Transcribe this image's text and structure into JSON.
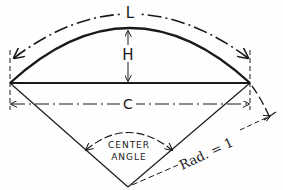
{
  "diagram": {
    "title": "",
    "labels": {
      "arc_length": "L",
      "height": "H",
      "chord": "C",
      "center_angle_line1": "CENTER",
      "center_angle_line2": "ANGLE",
      "radius": "Rad. = 1"
    },
    "elements": [
      {
        "name": "arc",
        "description": "circular arc segment (solid)"
      },
      {
        "name": "chord",
        "description": "straight line joining arc endpoints (solid)"
      },
      {
        "name": "arc-length-dimension",
        "label": "L",
        "style": "dash-dot with arrows"
      },
      {
        "name": "height-dimension",
        "label": "H",
        "style": "vertical arrow from chord to arc"
      },
      {
        "name": "chord-dimension",
        "label": "C",
        "style": "dash-dot with arrows"
      },
      {
        "name": "radii",
        "description": "two radii from center vertex to arc endpoints"
      },
      {
        "name": "center-angle-arc",
        "label": "CENTER ANGLE"
      },
      {
        "name": "radius-dimension",
        "label": "Rad. = 1"
      }
    ],
    "colors": {
      "ink": "#1a1a1a",
      "background": "#fefefe"
    }
  }
}
